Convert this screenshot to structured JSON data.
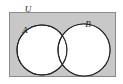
{
  "figure": {
    "name": "venn-diagram-two-sets",
    "type": "venn-diagram",
    "width": 123,
    "height": 84,
    "page_background": "#ffffff"
  },
  "universal_set": {
    "label": "U",
    "shape": "rectangle",
    "fill_color": "#c8c8c8",
    "stroke_color": "#8a8a8a",
    "x": 9,
    "y": 12,
    "width": 107,
    "height": 65,
    "label_x": 28,
    "label_y": 12,
    "label_font_size": 9
  },
  "sets": [
    {
      "label": "A",
      "shape": "circle",
      "fill_color": "#ffffff",
      "stroke_color": "#242424",
      "cx": 42,
      "cy": 50,
      "r": 25,
      "label_x": 25,
      "label_y": 33,
      "label_font_size": 9
    },
    {
      "label": "B",
      "shape": "circle",
      "fill_color": "#ffffff",
      "stroke_color": "#242424",
      "cx": 84,
      "cy": 50,
      "r": 26,
      "label_x": 88,
      "label_y": 27,
      "label_font_size": 9
    }
  ],
  "colors": {
    "universe_fill": "#c8c8c8",
    "universe_stroke": "#8a8a8a",
    "circle_fill": "#ffffff",
    "circle_stroke": "#242424",
    "label_color": "#1a1a1a"
  }
}
